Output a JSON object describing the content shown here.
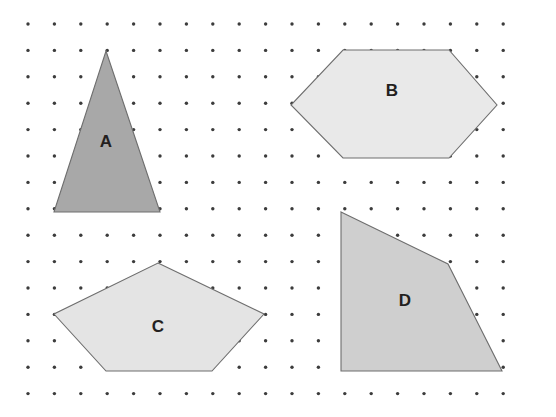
{
  "figure": {
    "background_color": "#ffffff",
    "width": 556,
    "height": 417
  },
  "grid": {
    "type": "square-dot-lattice",
    "dot_color": "#3c3c3c",
    "dot_radius": 1.7,
    "spacing_x": 26.4,
    "spacing_y": 26.4,
    "origin_x": 28,
    "origin_y": 24,
    "columns": 19,
    "rows": 15
  },
  "shapes": [
    {
      "id": "A",
      "label": "A",
      "kind": "triangle",
      "sides": 3,
      "fill": "#a8a8a8",
      "stroke": "#6e6e6e",
      "label_x": 106,
      "label_y": 143,
      "points": "106,51 160,212 54,212"
    },
    {
      "id": "B",
      "label": "B",
      "kind": "hexagon",
      "sides": 6,
      "fill": "#e9e9e9",
      "stroke": "#8a8a8a",
      "label_x": 392,
      "label_y": 92,
      "points": "343,50 449,50 497,105 449,158 343,158 291,105"
    },
    {
      "id": "C",
      "label": "C",
      "kind": "pentagon",
      "sides": 5,
      "fill": "#e4e4e4",
      "stroke": "#8a8a8a",
      "label_x": 158,
      "label_y": 328,
      "points": "158,263 264,314 212,371 106,371 54,314"
    },
    {
      "id": "D",
      "label": "D",
      "kind": "quadrilateral",
      "sides": 4,
      "fill": "#cfcfcf",
      "stroke": "#8a8a8a",
      "label_x": 405,
      "label_y": 302,
      "points": "341,212 448,264 502,371 341,371"
    }
  ]
}
